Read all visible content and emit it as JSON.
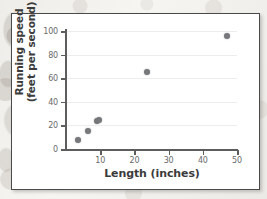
{
  "chart_data": {
    "type": "scatter",
    "title": "",
    "xlabel": "Length (inches)",
    "ylabel_line1": "Running speed",
    "ylabel_line2": "(feet per second)",
    "xlim": [
      0,
      50
    ],
    "ylim": [
      0,
      100
    ],
    "xticks": [
      10,
      20,
      30,
      40,
      50
    ],
    "yticks": [
      0,
      20,
      40,
      60,
      80,
      100
    ],
    "grid": "horizontal",
    "legend": "none",
    "marker_color": "#76787b",
    "axis_color": "#5d5d5d",
    "gridline_color": "#ededed",
    "points": [
      {
        "x": 3.5,
        "y": 8
      },
      {
        "x": 6.5,
        "y": 15
      },
      {
        "x": 9.0,
        "y": 24
      },
      {
        "x": 9.6,
        "y": 25
      },
      {
        "x": 23.7,
        "y": 65
      },
      {
        "x": 47.0,
        "y": 96
      }
    ]
  }
}
